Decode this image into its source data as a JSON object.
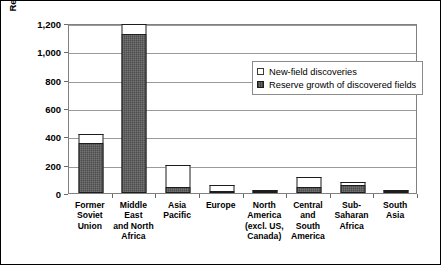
{
  "chart_data": {
    "type": "bar",
    "subtype": "stacked-vertical",
    "title": "",
    "xlabel": "",
    "ylabel": "Recoverable Natural Gas (TCF)",
    "ylim": [
      0,
      1200
    ],
    "yticks": [
      "0",
      "200",
      "400",
      "600",
      "800",
      "1,000",
      "1,200"
    ],
    "ytick_values": [
      0,
      200,
      400,
      600,
      800,
      1000,
      1200
    ],
    "grid": true,
    "grid_axis": "y",
    "legend_position": "top-center-inside",
    "categories": [
      "Former Soviet Union",
      "Middle East and North Africa",
      "Asia Pacific",
      "Europe",
      "North America (excl. US, Canada)",
      "Central and South America",
      "Sub-Saharan Africa",
      "South Asia"
    ],
    "category_lines": [
      [
        "Former",
        "Soviet",
        "Union"
      ],
      [
        "Middle",
        "East",
        "and North",
        "Africa"
      ],
      [
        "Asia",
        "Pacific"
      ],
      [
        "Europe"
      ],
      [
        "North",
        "America",
        "(excl. US,",
        "Canada)"
      ],
      [
        "Central",
        "and",
        "South",
        "America"
      ],
      [
        "Sub-",
        "Saharan",
        "Africa"
      ],
      [
        "South",
        "Asia"
      ]
    ],
    "series": [
      {
        "name": "Reserve growth of discovered fields",
        "color": "#595959",
        "values": [
          350,
          1120,
          40,
          12,
          10,
          40,
          55,
          8
        ]
      },
      {
        "name": "New-field discoveries",
        "color": "#ffffff",
        "values": [
          70,
          70,
          155,
          43,
          5,
          70,
          25,
          7
        ]
      }
    ],
    "totals": [
      420,
      1190,
      195,
      55,
      15,
      110,
      80,
      15
    ]
  },
  "legend": {
    "items": [
      {
        "label": "New-field discoveries",
        "swatch": "open"
      },
      {
        "label": "Reserve growth of discovered fields",
        "swatch": "filled"
      }
    ]
  },
  "axis": {
    "y_title": "Recoverable Natural Gas (TCF)"
  }
}
